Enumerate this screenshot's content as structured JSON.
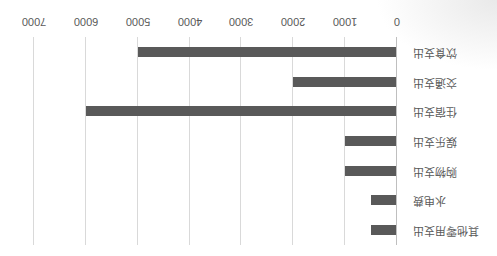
{
  "chart_data": {
    "type": "bar",
    "orientation": "horizontal",
    "title": "",
    "xlabel": "",
    "ylabel": "",
    "categories": [
      "其他零用支出",
      "水电费",
      "购物支出",
      "娱乐支出",
      "住宿支出",
      "交通支出",
      "饮食支出"
    ],
    "values": [
      500,
      500,
      1000,
      1000,
      6000,
      2000,
      5000
    ],
    "xlim": [
      0,
      7000
    ],
    "xticks": [
      "0",
      "1000",
      "2000",
      "3000",
      "4000",
      "5000",
      "6000",
      "7000"
    ],
    "grid": true,
    "legend": null,
    "bar_color": "#595959",
    "gridline_color": "#d9d9d9",
    "rotation_as_displayed_deg": 180
  }
}
